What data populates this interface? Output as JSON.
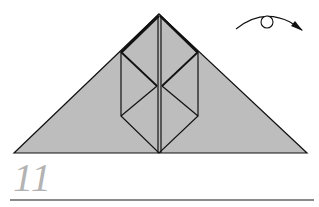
{
  "step": {
    "number": "11"
  },
  "diagram": {
    "paper_color": "#bdbdbd",
    "line_color": "#111111",
    "step_number_color": "#b3b3b3",
    "rule_color": "#8a8a8a",
    "symbols": [
      "turn-over-arrow-icon"
    ]
  }
}
